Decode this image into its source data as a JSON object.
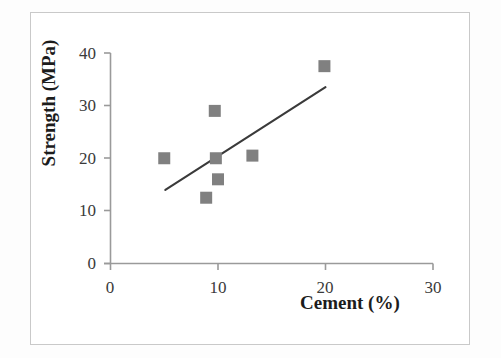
{
  "chart_data": {
    "type": "scatter",
    "title": "",
    "xlabel": "Cement (%)",
    "ylabel": "Strength (MPa)",
    "xlim": [
      0,
      30
    ],
    "ylim": [
      0,
      40
    ],
    "xticks": [
      "0",
      "10",
      "20",
      "30"
    ],
    "yticks": [
      "0",
      "10",
      "20",
      "30",
      "40"
    ],
    "xtick_values": [
      0,
      10,
      20,
      30
    ],
    "ytick_values": [
      0,
      10,
      20,
      30,
      40
    ],
    "grid": false,
    "legend": "none",
    "marker_style": "square",
    "marker_color": "#808080",
    "series": [
      {
        "name": "Cement vs Strength",
        "points": [
          {
            "x": 5.0,
            "y": 20.0
          },
          {
            "x": 8.9,
            "y": 12.5
          },
          {
            "x": 9.7,
            "y": 29.0
          },
          {
            "x": 9.8,
            "y": 20.0
          },
          {
            "x": 10.0,
            "y": 16.0
          },
          {
            "x": 13.2,
            "y": 20.5
          },
          {
            "x": 19.9,
            "y": 37.5
          }
        ]
      }
    ],
    "trendline": {
      "type": "linear",
      "color": "#3a3a3a",
      "x_start": 5.1,
      "y_start": 14.0,
      "x_end": 20.0,
      "y_end": 33.5
    },
    "axis_color": "#9a9a9a",
    "frame_color": "#c9c9c9"
  }
}
